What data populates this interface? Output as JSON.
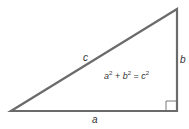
{
  "diagram": {
    "colors": {
      "stroke": "#6b6b6b",
      "text": "#333333",
      "background": "#ffffff"
    },
    "vertices": {
      "left": [
        11,
        111
      ],
      "right_angle": [
        177,
        111
      ],
      "top": [
        177,
        9
      ]
    },
    "labels": {
      "hypotenuse": "c",
      "vertical_leg": "b",
      "horizontal_leg": "a"
    },
    "equation": {
      "a": "a",
      "a_exp": "2",
      "plus": "+",
      "b": "b",
      "b_exp": "2",
      "equals": "=",
      "c": "c",
      "c_exp": "2"
    },
    "right_angle_marker": true
  }
}
